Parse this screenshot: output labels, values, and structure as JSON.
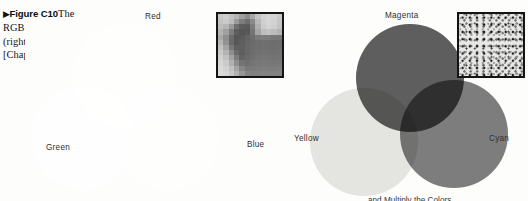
{
  "figure": {
    "marker": "▶",
    "number": "Figure C10",
    "text_line1": "The",
    "text_line2": "RGB (left) and CMYK",
    "text_line3": "(right) color models",
    "text_line4": "[Chapter 10]"
  },
  "rgb_diagram": {
    "name": "RGB additive color model",
    "labels": {
      "top": "Red",
      "left": "Green",
      "right": "Blue"
    },
    "circle_colors": {
      "red": "#6a6a6a",
      "green": "#8c8c8c",
      "blue": "#7f7f7f"
    },
    "center_color": "#ffffff",
    "background": "#fdfdfc",
    "inset": {
      "name": "pixelated-grayscale-photo",
      "border_color": "#141414",
      "cols": 12,
      "rows": 12,
      "pixels": [
        "#c9c9c9",
        "#cfcfcf",
        "#c2c2c2",
        "#b6b6b6",
        "#9f9f9f",
        "#8d8d8d",
        "#a9a9a9",
        "#c4c4c4",
        "#d2d2d2",
        "#d8d8d8",
        "#d4d4d4",
        "#cacaca",
        "#c4c4c4",
        "#cacaca",
        "#bdbdbd",
        "#9b9b9b",
        "#7d7d7d",
        "#6e6e6e",
        "#8a8a8a",
        "#b8b8b8",
        "#d0d0d0",
        "#d6d6d6",
        "#d2d2d2",
        "#c6c6c6",
        "#bebebe",
        "#b4b4b4",
        "#9a9a9a",
        "#6f6f6f",
        "#5d5d5d",
        "#5a5a5a",
        "#7c7c7c",
        "#b0b0b0",
        "#cccccc",
        "#d4d4d4",
        "#cfcfcf",
        "#c2c2c2",
        "#b4b4b4",
        "#a0a0a0",
        "#7e7e7e",
        "#5d5d5d",
        "#555555",
        "#585858",
        "#747474",
        "#a4a4a4",
        "#bdbdbd",
        "#c2c2c2",
        "#bcbcbc",
        "#b4b4b4",
        "#a9a9a9",
        "#8e8e8e",
        "#6b6b6b",
        "#565656",
        "#5a5a5a",
        "#636363",
        "#6d6d6d",
        "#7a7a7a",
        "#7e7e7e",
        "#7c7c7c",
        "#777777",
        "#767676",
        "#b6b6b6",
        "#929292",
        "#6a6a6a",
        "#585858",
        "#5e5e5e",
        "#656565",
        "#6a6a6a",
        "#6e6e6e",
        "#707070",
        "#6f6f6f",
        "#6d6d6d",
        "#6e6e6e",
        "#c2c2c2",
        "#a4a4a4",
        "#787878",
        "#5f5f5f",
        "#606060",
        "#686868",
        "#6c6c6c",
        "#6e6e6e",
        "#707070",
        "#6f6f6f",
        "#6e6e6e",
        "#6f6f6f",
        "#cacaca",
        "#b4b4b4",
        "#8f8f8f",
        "#6a6a6a",
        "#5e5e5e",
        "#676767",
        "#6d6d6d",
        "#707070",
        "#727272",
        "#717171",
        "#707070",
        "#717171",
        "#d0d0d0",
        "#c0c0c0",
        "#a2a2a2",
        "#7c7c7c",
        "#646464",
        "#6a6a6a",
        "#707070",
        "#737373",
        "#757575",
        "#747474",
        "#737373",
        "#747474",
        "#d6d6d6",
        "#cacaca",
        "#b0b0b0",
        "#8e8e8e",
        "#737373",
        "#6f6f6f",
        "#747474",
        "#777777",
        "#797979",
        "#787878",
        "#777777",
        "#787878",
        "#dadada",
        "#d2d2d2",
        "#c0c0c0",
        "#a4a4a4",
        "#868686",
        "#797979",
        "#7a7a7a",
        "#7c7c7c",
        "#7e7e7e",
        "#7d7d7d",
        "#7c7c7c",
        "#7d7d7d",
        "#dcdcdc",
        "#d6d6d6",
        "#c8c8c8",
        "#b2b2b2",
        "#969696",
        "#848484",
        "#808080",
        "#818181",
        "#838383",
        "#828282",
        "#818181",
        "#828282"
      ]
    }
  },
  "cmyk_diagram": {
    "name": "CMYK subtractive color model",
    "labels": {
      "top": "Magenta",
      "left": "Yellow",
      "right": "Cyan"
    },
    "circle_colors": {
      "magenta": "#5f5f5f",
      "yellow": "#e6e6e4",
      "cyan": "#7e7e7e"
    },
    "center_color": "#0b0b0b",
    "background": "#fdfdfc",
    "caption_clipped": "and Multiply the Colors",
    "inset": {
      "name": "halftone-rosette-pattern",
      "border_color": "#141414"
    }
  }
}
